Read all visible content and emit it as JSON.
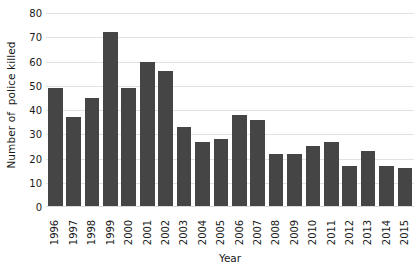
{
  "chart_data": {
    "type": "bar",
    "title": "",
    "subtitle": "",
    "xlabel": "Year",
    "ylabel": "Number of  police killed",
    "categories": [
      "1996",
      "1997",
      "1998",
      "1999",
      "2000",
      "2001",
      "2002",
      "2003",
      "2004",
      "2005",
      "2006",
      "2007",
      "2008",
      "2009",
      "2010",
      "2011",
      "2012",
      "2013",
      "2014",
      "2015"
    ],
    "values": [
      49,
      37,
      45,
      72,
      49,
      60,
      56,
      33,
      27,
      28,
      38,
      36,
      22,
      22,
      25,
      27,
      17,
      23,
      17,
      16
    ],
    "series": [
      {
        "name": "Number of police killed",
        "values": [
          49,
          37,
          45,
          72,
          49,
          60,
          56,
          33,
          27,
          28,
          38,
          36,
          22,
          22,
          25,
          27,
          17,
          23,
          17,
          16
        ]
      }
    ],
    "ylim": [
      0,
      80
    ],
    "xlim_categories": [
      "1996",
      "2015"
    ],
    "yticks": [
      0,
      10,
      20,
      30,
      40,
      50,
      60,
      70,
      80
    ],
    "ytick_labels": [
      "0",
      "10",
      "20",
      "30",
      "40",
      "50",
      "60",
      "70",
      "80"
    ],
    "xtick_labels": [
      "1996",
      "1997",
      "1998",
      "1999",
      "2000",
      "2001",
      "2002",
      "2003",
      "2004",
      "2005",
      "2006",
      "2007",
      "2008",
      "2009",
      "2010",
      "2011",
      "2012",
      "2013",
      "2014",
      "2015"
    ],
    "grid": {
      "horizontal": true,
      "vertical": false
    },
    "legend": {
      "visible": false,
      "position": "none",
      "entries": []
    },
    "annotations": [],
    "colors": {
      "bar": "#454545",
      "gridline": "#e2e2e2",
      "axis": "#d9d9d9",
      "text": "#1a1a1a",
      "background": "#ffffff"
    },
    "xtick_rotation": -90
  },
  "caption": {
    "remnant_text": ""
  }
}
